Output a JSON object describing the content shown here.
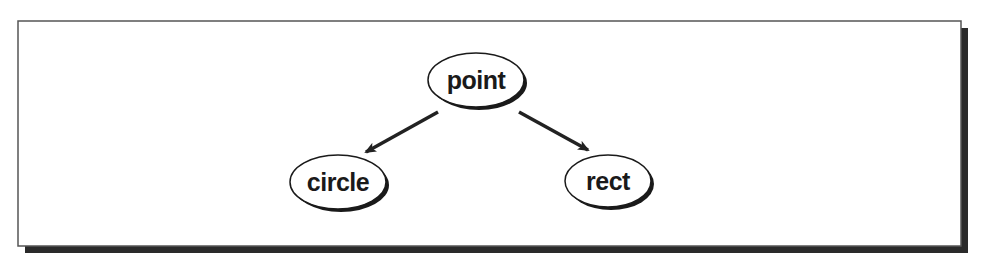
{
  "diagram": {
    "type": "class-hierarchy",
    "nodes": [
      {
        "id": "point",
        "label": "point",
        "cx": 476,
        "cy": 80,
        "rx": 48,
        "ry": 27
      },
      {
        "id": "circle",
        "label": "circle",
        "cx": 338,
        "cy": 182,
        "rx": 48,
        "ry": 27
      },
      {
        "id": "rect",
        "label": "rect",
        "cx": 608,
        "cy": 181,
        "rx": 43,
        "ry": 26
      }
    ],
    "edges": [
      {
        "from": "point",
        "to": "circle",
        "x1": 438,
        "y1": 112,
        "x2": 366,
        "y2": 152
      },
      {
        "from": "point",
        "to": "rect",
        "x1": 519,
        "y1": 112,
        "x2": 588,
        "y2": 150
      }
    ],
    "colors": {
      "frame": "#555555",
      "shadow": "#2a2a2a",
      "node_stroke": "#1a1a1a",
      "node_fill": "#ffffff",
      "arrow": "#222222",
      "text": "#1a1a1a"
    }
  }
}
